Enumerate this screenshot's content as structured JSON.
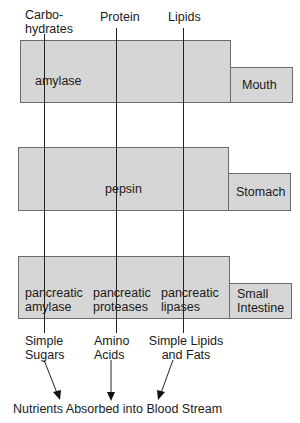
{
  "diagram": {
    "type": "digestion-flow",
    "colors": {
      "box_fill": "#d6d6d6",
      "box_border": "#6a6a6a",
      "line": "#222222",
      "text": "#1a1a1a"
    },
    "nutrients": [
      {
        "label_line1": "Carbo-",
        "label_line2": "hydrates"
      },
      {
        "label_line1": "Protein"
      },
      {
        "label_line1": "Lipids"
      }
    ],
    "stages": [
      {
        "organ": "Mouth",
        "enzymes": [
          {
            "line1": "amylase"
          }
        ]
      },
      {
        "organ": "Stomach",
        "enzymes": [
          {
            "line1": "pepsin"
          }
        ]
      },
      {
        "organ_line1": "Small",
        "organ_line2": "Intestine",
        "enzymes": [
          {
            "line1": "pancreatic",
            "line2": "amylase"
          },
          {
            "line1": "pancreatic",
            "line2": "proteases"
          },
          {
            "line1": "pancreatic",
            "line2": "lipases"
          }
        ]
      }
    ],
    "products": [
      {
        "line1": "Simple",
        "line2": "Sugars"
      },
      {
        "line1": "Amino",
        "line2": "Acids"
      },
      {
        "line1": "Simple Lipids",
        "line2": "and Fats"
      }
    ],
    "footer": "Nutrients Absorbed into Blood Stream"
  }
}
